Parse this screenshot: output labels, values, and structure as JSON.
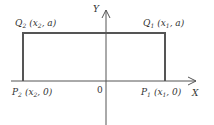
{
  "diagram": {
    "axes": {
      "x_label": "X",
      "y_label": "Y",
      "origin_label": "0"
    },
    "points": {
      "Q2": {
        "name": "Q",
        "sub": "2",
        "coords": "(x",
        "coord_sub": "2",
        "rest": ", a)"
      },
      "Q1": {
        "name": "Q",
        "sub": "1",
        "coords": "(x",
        "coord_sub": "1",
        "rest": ", a)"
      },
      "P2": {
        "name": "P",
        "sub": "2",
        "coords": "(x",
        "coord_sub": "2",
        "rest": ", 0)"
      },
      "P1": {
        "name": "P",
        "sub": "1",
        "coords": "(x",
        "coord_sub": "1",
        "rest": ", 0)"
      }
    },
    "colors": {
      "axis": "#555555",
      "rectangle": "#555555",
      "text": "#333333"
    }
  }
}
